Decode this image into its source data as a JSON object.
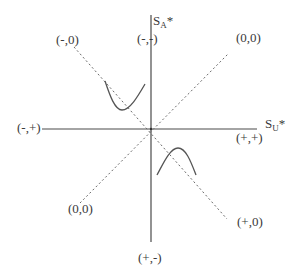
{
  "diagram": {
    "type": "phase-diagram",
    "colors": {
      "axis": "#4a4a4a",
      "dashed": "#6a6a6a",
      "curve": "#555555",
      "text": "#3a3a3a"
    },
    "axes": {
      "vertical": {
        "main": "S",
        "sub": "A",
        "suffix": "*"
      },
      "horizontal": {
        "main": "S",
        "sub": "U",
        "suffix": "*"
      }
    },
    "labels": {
      "top_left": "(-,0)",
      "top": "(-,-)",
      "top_right": "(0,0)",
      "left": "(-,+)",
      "right": "(+,+)",
      "bottom_left": "(0,0)",
      "bottom_right": "(+,0)",
      "bottom": "(+,-)"
    },
    "lines": {
      "dashed_1": {
        "from": [
          72,
          38
        ],
        "to": [
          227,
          218
        ],
        "desc": "dashed line from upper-left (-,0) to lower-right (+,0)"
      },
      "dashed_2": {
        "from": [
          80,
          203
        ],
        "to": [
          229,
          55
        ],
        "desc": "dashed line from lower-left (0,0) to upper-right (0,0)"
      }
    },
    "curves": {
      "upper_left": "U-shaped curve crossing dashed line in upper-left quadrant",
      "lower_right": "inverted-U curve crossing dashed line in lower-right quadrant"
    }
  }
}
